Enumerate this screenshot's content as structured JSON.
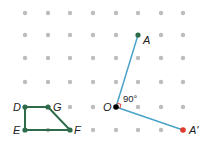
{
  "diagram": {
    "grid": {
      "xs": [
        25,
        48,
        70,
        93,
        116,
        138,
        161,
        183
      ],
      "ys": [
        13,
        35,
        58,
        82,
        107,
        130
      ],
      "dot_color": "#bdbdbd"
    },
    "colors": {
      "shape": "#2e6b4a",
      "ray": "#4aa3c8",
      "center": "#000000",
      "image_point": "#e03a2e",
      "right_angle_mark": "#e03a2e"
    },
    "points": {
      "A": {
        "label": "A",
        "x": 138,
        "y": 35
      },
      "O": {
        "label": "O",
        "x": 116,
        "y": 107
      },
      "A_prime": {
        "label": "A'",
        "x": 183,
        "y": 130
      },
      "D": {
        "label": "D",
        "x": 25,
        "y": 107
      },
      "G": {
        "label": "G",
        "x": 48,
        "y": 107
      },
      "E": {
        "label": "E",
        "x": 25,
        "y": 130
      },
      "F": {
        "label": "F",
        "x": 70,
        "y": 130
      }
    },
    "angle_label": "90°"
  }
}
